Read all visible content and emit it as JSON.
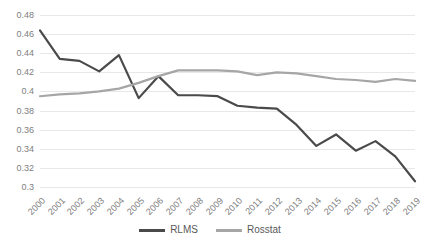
{
  "chart_data": {
    "type": "line",
    "title": "",
    "xlabel": "",
    "ylabel": "",
    "grid": true,
    "legend_position": "bottom",
    "ylim": [
      0.3,
      0.48
    ],
    "ytick_step": 0.02,
    "yticks": [
      "0.48",
      "0.46",
      "0.44",
      "0.42",
      "0.4",
      "0.38",
      "0.36",
      "0.34",
      "0.32",
      "0.3"
    ],
    "ytick_values": [
      0.48,
      0.46,
      0.44,
      0.42,
      0.4,
      0.38,
      0.36,
      0.34,
      0.32,
      0.3
    ],
    "categories": [
      "2000",
      "2001",
      "2002",
      "2003",
      "2004",
      "2005",
      "2006",
      "2007",
      "2008",
      "2009",
      "2010",
      "2011",
      "2012",
      "2013",
      "2014",
      "2015",
      "2016",
      "2017",
      "2018",
      "2019"
    ],
    "series": [
      {
        "name": "RLMS",
        "color": "#4a4a4a",
        "values": [
          0.464,
          0.434,
          0.432,
          0.421,
          0.438,
          0.393,
          0.416,
          0.396,
          0.396,
          0.395,
          0.385,
          0.383,
          0.382,
          0.365,
          0.343,
          0.355,
          0.338,
          0.348,
          0.332,
          0.306
        ]
      },
      {
        "name": "Rosstat",
        "color": "#a6a6a6",
        "values": [
          0.395,
          0.397,
          0.398,
          0.4,
          0.403,
          0.409,
          0.416,
          0.422,
          0.422,
          0.422,
          0.421,
          0.417,
          0.42,
          0.419,
          0.416,
          0.413,
          0.412,
          0.41,
          0.413,
          0.411
        ]
      }
    ]
  },
  "legend": {
    "items": [
      {
        "label": "RLMS",
        "color": "#4a4a4a"
      },
      {
        "label": "Rosstat",
        "color": "#a6a6a6"
      }
    ]
  },
  "colors": {
    "rlms": "#4a4a4a",
    "rosstat": "#a6a6a6",
    "gridline": "#e8e8e8",
    "tick_text": "#808080",
    "legend_text": "#595959",
    "background": "#ffffff"
  }
}
